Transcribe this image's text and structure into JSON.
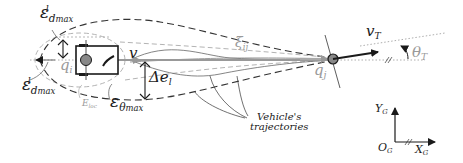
{
  "diagram": {
    "labels": {
      "eps_d_max_top": {
        "symbol": "ε",
        "sup": "l",
        "sub": "d_max"
      },
      "eps_d_max_bottom": {
        "symbol": "ε",
        "sup": "l",
        "sub": "d_max"
      },
      "eps_theta_max": {
        "symbol": "ε",
        "sub": "θ_max"
      },
      "q_i": {
        "symbol": "q",
        "sub": "i"
      },
      "v": "v",
      "delta_e_l": {
        "symbol": "Δe",
        "sub": "l"
      },
      "e_loc": {
        "symbol": "E",
        "sub": "loc"
      },
      "xi_ij": {
        "symbol": "ξ",
        "sub": "ij"
      },
      "q_j": {
        "symbol": "q",
        "sub": "j"
      },
      "v_T": {
        "symbol": "v",
        "sub": "T"
      },
      "theta_T": {
        "symbol": "θ",
        "sub": "T"
      },
      "vehicle_trajectories": [
        "Vehicle's",
        "trajectories"
      ],
      "Y_G": {
        "symbol": "Y",
        "sub": "G"
      },
      "X_G": {
        "symbol": "X",
        "sub": "G"
      },
      "O_G": {
        "symbol": "O",
        "sub": "G"
      }
    },
    "colors": {
      "ink": "#1a1a1a",
      "gray": "#9a9a9a",
      "vehicle_fill": "#888888"
    }
  }
}
